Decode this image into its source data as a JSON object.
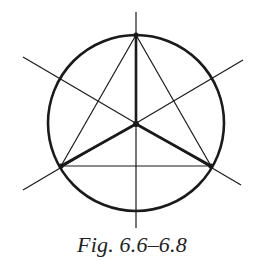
{
  "figure": {
    "caption": "Fig. 6.6–6.8",
    "stroke_color": "#1a1a1a",
    "background": "#ffffff",
    "circle": {
      "cx": 136,
      "cy": 123,
      "r": 88
    },
    "center_point": {
      "x": 136,
      "y": 124
    },
    "triangle_vertices": [
      {
        "x": 136,
        "y": 35
      },
      {
        "x": 61,
        "y": 166
      },
      {
        "x": 211,
        "y": 166
      }
    ],
    "axis_lines": [
      {
        "x1": 136,
        "y1": 12,
        "x2": 136,
        "y2": 228
      },
      {
        "x1": 23,
        "y1": 57,
        "x2": 241,
        "y2": 185
      },
      {
        "x1": 23,
        "y1": 190,
        "x2": 243,
        "y2": 60
      }
    ]
  }
}
